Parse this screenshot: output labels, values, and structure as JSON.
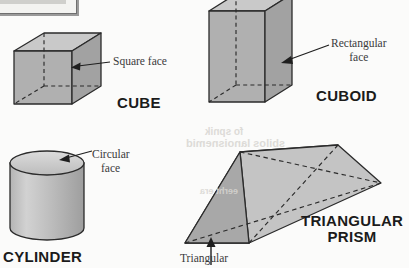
{
  "page": {
    "background_color": "#fbfbfa",
    "ink_color": "#1b1b1b",
    "shape_fill_light": "#c8c8c8",
    "shape_fill_mid": "#aaaaaa",
    "shape_fill_dark": "#9a9a9a",
    "outline_color": "#2b2b2b"
  },
  "top_box": {
    "name": "clipped-text-box",
    "fill": "#f3f3f1",
    "inner_fill": "#cfcfcc",
    "border": "#6f6f6f"
  },
  "shapes": [
    {
      "id": "cube",
      "name": "CUBE",
      "callout": "Square face",
      "callout_lines": [
        "Square face"
      ]
    },
    {
      "id": "cuboid",
      "name": "CUBOID",
      "callout": "Rectangular face",
      "callout_lines": [
        "Rectangular",
        "face"
      ]
    },
    {
      "id": "cylinder",
      "name": "CYLINDER",
      "callout": "Circular face",
      "callout_lines": [
        "Circular",
        "face"
      ]
    },
    {
      "id": "triangular-prism",
      "name": "TRIANGULAR PRISM",
      "name_lines": [
        "TRIANGULAR",
        "PRISM"
      ],
      "callout": "Triangular",
      "callout_lines": [
        "Triangular"
      ]
    }
  ],
  "bleed_text": {
    "line1": "fo spnik",
    "line2": "sbilos lanoisnemid",
    "line3": "eerht era"
  }
}
